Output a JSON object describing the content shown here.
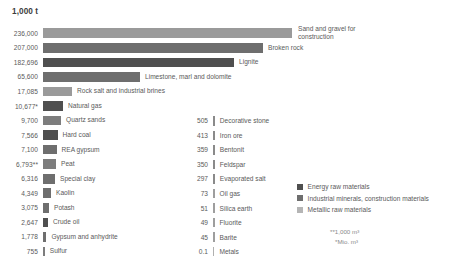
{
  "chart_data": {
    "type": "bar",
    "title": "1,000 t",
    "xlabel": "",
    "ylabel": "",
    "orientation": "horizontal",
    "grid": false,
    "legend_position": "bottom-right",
    "categories": [
      "Sand and gravel for construction",
      "Broken rock",
      "Lignite",
      "Limestone, marl and dolomite",
      "Rock salt and industrial brines",
      "Natural gas",
      "Quartz sands",
      "Hard coal",
      "REA gypsum",
      "Peat",
      "Special clay",
      "Kaolin",
      "Potash",
      "Crude oil",
      "Gypsum and anhydrite",
      "Sulfur",
      "Decorative stone",
      "Iron ore",
      "Bentonit",
      "Feldspar",
      "Evaporated salt",
      "Oil gas",
      "Silica earth",
      "Fluorite",
      "Barite",
      "Metals"
    ],
    "values": [
      236000,
      207000,
      182696,
      65600,
      17085,
      10677,
      9700,
      7566,
      7100,
      6793,
      6316,
      4349,
      3075,
      2647,
      1778,
      755,
      505,
      413,
      359,
      350,
      297,
      73,
      51,
      49,
      45,
      0.1
    ],
    "value_labels": [
      "236,000",
      "207,000",
      "182,696",
      "65,600",
      "17,085",
      "10,677*",
      "9,700",
      "7,566",
      "7,100",
      "6,793**",
      "6,316",
      "4,349",
      "3,075",
      "2,647",
      "1,778",
      "755",
      "505",
      "413",
      "359",
      "350",
      "297",
      "73",
      "51",
      "49",
      "45",
      "0.1"
    ]
  },
  "chart": {
    "title": "1,000 t",
    "main_series": [
      {
        "value_label": "236,000",
        "label": "Sand and gravel for construction",
        "bar_px": 249,
        "color": "#9a9a9a",
        "category": "industrial",
        "two_line": true
      },
      {
        "value_label": "207,000",
        "label": "Broken rock",
        "bar_px": 220,
        "color": "#6e6e6e",
        "category": "industrial",
        "two_line": false
      },
      {
        "value_label": "182,696",
        "label": "Lignite",
        "bar_px": 191,
        "color": "#4f4f4f",
        "category": "energy",
        "two_line": false
      },
      {
        "value_label": "65,600",
        "label": "Limestone, marl and dolomite",
        "bar_px": 97,
        "color": "#6e6e6e",
        "category": "industrial",
        "two_line": false
      },
      {
        "value_label": "17,085",
        "label": "Rock salt and industrial brines",
        "bar_px": 29,
        "color": "#9a9a9a",
        "category": "industrial",
        "two_line": false
      },
      {
        "value_label": "10,677*",
        "label": "Natural gas",
        "bar_px": 20,
        "color": "#4f4f4f",
        "category": "energy",
        "two_line": false
      },
      {
        "value_label": "9,700",
        "label": "Quartz sands",
        "bar_px": 18,
        "color": "#7d7d7d",
        "category": "industrial",
        "two_line": false
      },
      {
        "value_label": "7,566",
        "label": "Hard coal",
        "bar_px": 14.5,
        "color": "#4f4f4f",
        "category": "energy",
        "two_line": false
      },
      {
        "value_label": "7,100",
        "label": "REA gypsum",
        "bar_px": 13.5,
        "color": "#6e6e6e",
        "category": "industrial",
        "two_line": false
      },
      {
        "value_label": "6,793**",
        "label": "Peat",
        "bar_px": 13,
        "color": "#7d7d7d",
        "category": "industrial",
        "two_line": false
      },
      {
        "value_label": "6,316",
        "label": "Special clay",
        "bar_px": 12,
        "color": "#6e6e6e",
        "category": "industrial",
        "two_line": false
      },
      {
        "value_label": "4,349",
        "label": "Kaolin",
        "bar_px": 8,
        "color": "#6e6e6e",
        "category": "industrial",
        "two_line": false
      },
      {
        "value_label": "3,075",
        "label": "Potash",
        "bar_px": 6,
        "color": "#6e6e6e",
        "category": "industrial",
        "two_line": false
      },
      {
        "value_label": "2,647",
        "label": "Crude oil",
        "bar_px": 5,
        "color": "#4f4f4f",
        "category": "energy",
        "two_line": false
      },
      {
        "value_label": "1,778",
        "label": "Gypsum and anhydrite",
        "bar_px": 3.4,
        "color": "#6e6e6e",
        "category": "industrial",
        "two_line": false
      },
      {
        "value_label": "755",
        "label": "Sulfur",
        "bar_px": 1.8,
        "color": "#7d7d7d",
        "category": "industrial",
        "two_line": false
      }
    ],
    "side_series": [
      {
        "value_label": "505",
        "label": "Decorative stone",
        "bar_px": 1.8,
        "color": "#8a8a8a",
        "category": "industrial"
      },
      {
        "value_label": "413",
        "label": "Iron ore",
        "bar_px": 1.8,
        "color": "#8a8a8a",
        "category": "industrial"
      },
      {
        "value_label": "359",
        "label": "Bentonit",
        "bar_px": 1.8,
        "color": "#8a8a8a",
        "category": "industrial"
      },
      {
        "value_label": "350",
        "label": "Feldspar",
        "bar_px": 1.8,
        "color": "#8a8a8a",
        "category": "industrial"
      },
      {
        "value_label": "297",
        "label": "Evaporated salt",
        "bar_px": 1.8,
        "color": "#8a8a8a",
        "category": "industrial"
      },
      {
        "value_label": "73",
        "label": "Oil gas",
        "bar_px": 1.6,
        "color": "#9e9e9e",
        "category": "energy"
      },
      {
        "value_label": "51",
        "label": "Silica earth",
        "bar_px": 1.6,
        "color": "#9e9e9e",
        "category": "industrial"
      },
      {
        "value_label": "49",
        "label": "Fluorite",
        "bar_px": 1.6,
        "color": "#9e9e9e",
        "category": "industrial"
      },
      {
        "value_label": "45",
        "label": "Barite",
        "bar_px": 1.6,
        "color": "#9e9e9e",
        "category": "industrial"
      },
      {
        "value_label": "0.1",
        "label": "Metals",
        "bar_px": 1.4,
        "color": "#b0b0b0",
        "category": "metallic"
      }
    ],
    "legend": [
      {
        "label": "Energy raw materials",
        "color": "#4f4f4f"
      },
      {
        "label": "Industrial minerals, construction materials",
        "color": "#6e6e6e"
      },
      {
        "label": "Metallic raw materials",
        "color": "#b5b5b5"
      }
    ],
    "footnotes": [
      "**1,000 m³",
      "*Mio. m³"
    ]
  }
}
